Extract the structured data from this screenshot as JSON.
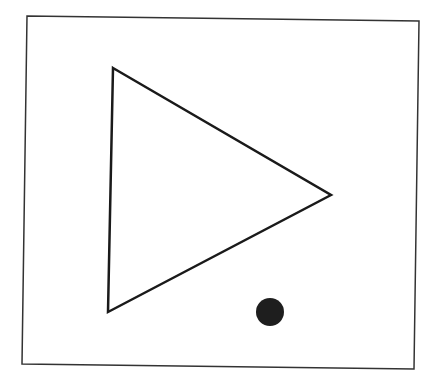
{
  "diagram": {
    "background": "#ffffff",
    "frame": {
      "points": "27,16 419,21 414,369 22,364",
      "stroke": "#333333",
      "stroke_width": 1.5
    },
    "triangle": {
      "points": "113,68 331,195 108,312",
      "stroke": "#1a1a1a",
      "stroke_width": 2.5,
      "fill": "none"
    },
    "dot": {
      "cx": 270,
      "cy": 312,
      "r": 14,
      "fill": "#1e1e1e"
    }
  }
}
